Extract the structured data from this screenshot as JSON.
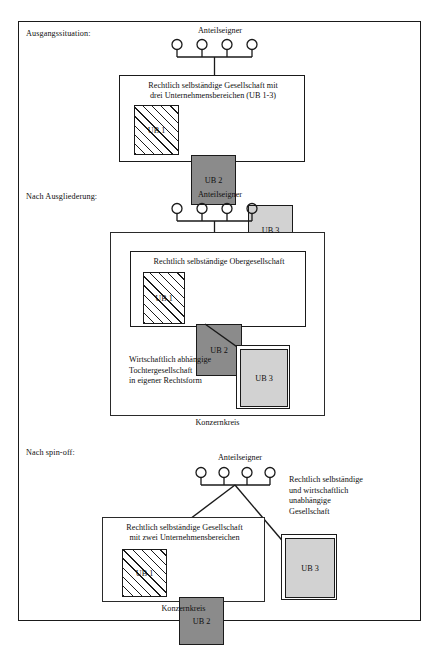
{
  "figure": {
    "title_visible": false,
    "background": "#ffffff",
    "ink": "#1a1a1a"
  },
  "legend_colors": {
    "ub1_pattern": "diagonal-hatch",
    "ub2_fill": "#8b8b8b",
    "ub3_fill": "#d2d2d2",
    "box_border": "#1a1a1a"
  },
  "panels": [
    {
      "id": "ausgangssituation",
      "stage_label": "Ausgangssituation:",
      "owners_label": "Anteilseigner",
      "owners_count": 4,
      "company_caption": "Rechtlich selbständige Gesellschaft mit\ndrei Unternehmensbereichen (UB 1-3)",
      "units": [
        {
          "id": "ub1",
          "label": "UB 1",
          "fill": "hatch"
        },
        {
          "id": "ub2",
          "label": "UB 2",
          "fill": "dark"
        },
        {
          "id": "ub3",
          "label": "UB 3",
          "fill": "light"
        }
      ],
      "group_label": null
    },
    {
      "id": "nach-ausgliederung",
      "stage_label": "Nach Ausgliederung:",
      "owners_label": "Anteilseigner",
      "owners_count": 4,
      "parent_caption": "Rechtlich selbständige Obergesellschaft",
      "parent_units": [
        {
          "id": "ub1",
          "label": "UB 1",
          "fill": "hatch"
        },
        {
          "id": "ub2",
          "label": "UB 2",
          "fill": "dark"
        }
      ],
      "subsidiary_caption": "Wirtschaftlich abhängige\nTochtergesellschaft\nin eigener Rechtsform",
      "subsidiary_unit": {
        "id": "ub3",
        "label": "UB 3",
        "fill": "light"
      },
      "group_label": "Konzernkreis"
    },
    {
      "id": "nach-spin-off",
      "stage_label": "Nach spin-off:",
      "owners_label": "Anteilseigner",
      "owners_count": 4,
      "company_caption": "Rechtlich selbständige Gesellschaft\nmit zwei Unternehmensbereichen",
      "units": [
        {
          "id": "ub1",
          "label": "UB 1",
          "fill": "hatch"
        },
        {
          "id": "ub2",
          "label": "UB 2",
          "fill": "dark"
        }
      ],
      "independent_caption": "Rechtlich selbständige\nund wirtschaftlich\nunabhängige\nGesellschaft",
      "independent_unit": {
        "id": "ub3",
        "label": "UB 3",
        "fill": "light"
      },
      "group_label": "Konzernkreis"
    }
  ]
}
